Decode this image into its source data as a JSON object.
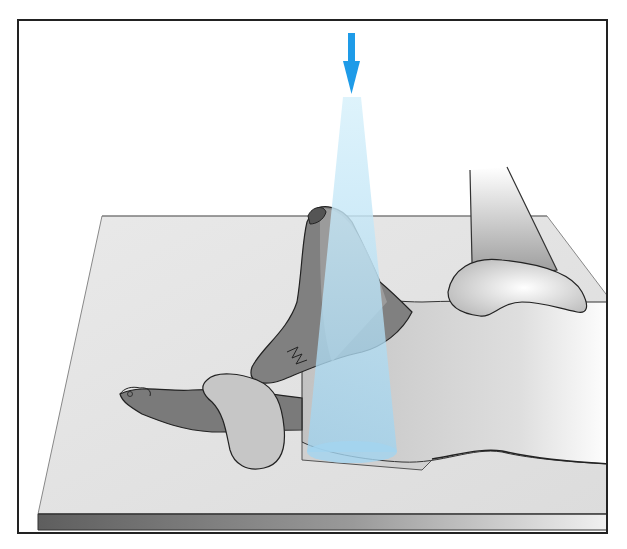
{
  "figure": {
    "type": "illustration",
    "colors": {
      "frame": "#222222",
      "beam_arrow": "#1e9be8",
      "beam_cone": "#a9dcf3",
      "table_top": "#e6e6e6",
      "table_edge_dark": "#6a6a6a",
      "dog_dark": "#7a7a7a",
      "dog_light": "#c8c8c8",
      "pad": "#d4d4d4"
    },
    "elements": [
      {
        "name": "beam-direction-arrow",
        "description": "Blue downward arrow indicating X-ray beam direction"
      },
      {
        "name": "xray-beam-cone",
        "description": "Translucent light-blue cone of primary beam"
      },
      {
        "name": "xray-table",
        "description": "Radiographic tabletop in perspective"
      },
      {
        "name": "cassette",
        "description": "Film cassette under the head"
      },
      {
        "name": "dog",
        "description": "Dog lying with head elevated, forelimb extended"
      },
      {
        "name": "positioning-pad",
        "description": "Foam positioning wedge under neck/shoulder"
      }
    ]
  }
}
